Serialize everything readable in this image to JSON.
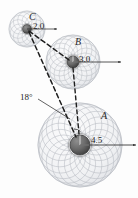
{
  "figure": {
    "type": "mechanism-diagram",
    "background_color": "#fdfdfd",
    "line_color": "#2b2b2b",
    "web_color": "#b9bdc4",
    "disk_fill": "#f2f3f5",
    "hub_dark": "#5d5d5d",
    "hub_light": "#a9a9a9"
  },
  "disks": [
    {
      "id": "A",
      "label": "A",
      "radius_value": "4.5",
      "center_x": 80,
      "center_y": 145,
      "radius_px": 42,
      "hub_radius_px": 10,
      "label_x": 101,
      "label_y": 111,
      "value_x": 91,
      "value_y": 136,
      "radius_arrow_angle_deg": 0
    },
    {
      "id": "B",
      "label": "B",
      "radius_value": "3.0",
      "center_x": 73,
      "center_y": 62,
      "radius_px": 27,
      "hub_radius_px": 6,
      "label_x": 75,
      "label_y": 37,
      "value_x": 79,
      "value_y": 55,
      "radius_arrow_angle_deg": 0
    },
    {
      "id": "C",
      "label": "C",
      "radius_value": "2.0",
      "center_x": 27,
      "center_y": 29,
      "radius_px": 18,
      "hub_radius_px": 4.5,
      "label_x": 29,
      "label_y": 12,
      "value_x": 33,
      "value_y": 22,
      "radius_arrow_angle_deg": 0
    }
  ],
  "annotations": {
    "angle": {
      "text": "18°",
      "value": 18,
      "unit": "degrees",
      "x": 20,
      "y": 93,
      "leader_from_x": 38,
      "leader_from_y": 99,
      "leader_to_x": 69,
      "leader_to_y": 118
    }
  },
  "links": [
    {
      "name": "link-C-to-A",
      "from": "C",
      "to": "A",
      "style": "dashed"
    },
    {
      "name": "link-B-to-A",
      "from": "B",
      "to": "A",
      "style": "dashed"
    },
    {
      "name": "link-C-to-B",
      "from": "C",
      "to": "B",
      "style": "dashed"
    }
  ],
  "chart_data": {
    "type": "scatter",
    "title": "",
    "categories": [
      "A",
      "B",
      "C"
    ],
    "values": [
      4.5,
      3.0,
      2.0
    ],
    "xlabel": "",
    "ylabel": "radius",
    "annotations": [
      "18°"
    ]
  }
}
